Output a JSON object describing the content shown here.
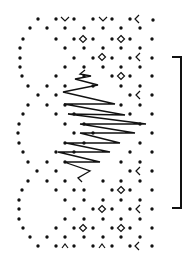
{
  "diagram": {
    "type": "knitting-lace-chart",
    "background": "#ffffff",
    "ink": "#111111",
    "dot_radius": 1.7,
    "dots": [
      [
        38,
        19
      ],
      [
        56,
        19
      ],
      [
        74,
        19
      ],
      [
        93,
        19
      ],
      [
        112,
        19
      ],
      [
        130,
        19
      ],
      [
        153,
        20
      ],
      [
        30,
        28
      ],
      [
        47,
        28
      ],
      [
        65,
        28
      ],
      [
        84,
        28
      ],
      [
        103,
        28
      ],
      [
        121,
        28
      ],
      [
        140,
        28
      ],
      [
        23,
        39
      ],
      [
        56,
        39
      ],
      [
        74,
        39
      ],
      [
        93,
        39
      ],
      [
        112,
        39
      ],
      [
        130,
        39
      ],
      [
        152,
        39
      ],
      [
        20,
        48
      ],
      [
        65,
        48
      ],
      [
        84,
        48
      ],
      [
        103,
        48
      ],
      [
        121,
        48
      ],
      [
        140,
        48
      ],
      [
        20,
        58
      ],
      [
        74,
        58
      ],
      [
        93,
        58
      ],
      [
        112,
        58
      ],
      [
        130,
        58
      ],
      [
        152,
        58
      ],
      [
        20,
        67
      ],
      [
        65,
        67
      ],
      [
        84,
        67
      ],
      [
        103,
        67
      ],
      [
        121,
        67
      ],
      [
        140,
        67
      ],
      [
        22,
        76
      ],
      [
        56,
        76
      ],
      [
        84,
        76
      ],
      [
        112,
        76
      ],
      [
        130,
        76
      ],
      [
        152,
        76
      ],
      [
        28,
        86
      ],
      [
        47,
        86
      ],
      [
        65,
        86
      ],
      [
        93,
        86
      ],
      [
        121,
        86
      ],
      [
        140,
        86
      ],
      [
        38,
        95
      ],
      [
        56,
        95
      ],
      [
        130,
        95
      ],
      [
        152,
        95
      ],
      [
        28,
        105
      ],
      [
        47,
        105
      ],
      [
        65,
        105
      ],
      [
        121,
        105
      ],
      [
        140,
        105
      ],
      [
        23,
        114
      ],
      [
        56,
        114
      ],
      [
        74,
        114
      ],
      [
        130,
        114
      ],
      [
        152,
        114
      ],
      [
        19,
        124
      ],
      [
        65,
        124
      ],
      [
        84,
        124
      ],
      [
        140,
        124
      ],
      [
        18,
        133
      ],
      [
        74,
        133
      ],
      [
        93,
        133
      ],
      [
        152,
        133
      ],
      [
        19,
        143
      ],
      [
        65,
        143
      ],
      [
        84,
        143
      ],
      [
        140,
        143
      ],
      [
        23,
        152
      ],
      [
        56,
        152
      ],
      [
        74,
        152
      ],
      [
        130,
        152
      ],
      [
        152,
        152
      ],
      [
        28,
        162
      ],
      [
        47,
        162
      ],
      [
        65,
        162
      ],
      [
        121,
        162
      ],
      [
        140,
        162
      ],
      [
        37,
        171
      ],
      [
        56,
        171
      ],
      [
        130,
        171
      ],
      [
        152,
        171
      ],
      [
        28,
        181
      ],
      [
        47,
        181
      ],
      [
        65,
        181
      ],
      [
        103,
        181
      ],
      [
        121,
        181
      ],
      [
        140,
        181
      ],
      [
        22,
        190
      ],
      [
        56,
        190
      ],
      [
        74,
        190
      ],
      [
        84,
        190
      ],
      [
        112,
        190
      ],
      [
        130,
        190
      ],
      [
        152,
        190
      ],
      [
        19,
        200
      ],
      [
        65,
        200
      ],
      [
        84,
        200
      ],
      [
        103,
        200
      ],
      [
        121,
        200
      ],
      [
        140,
        200
      ],
      [
        19,
        209
      ],
      [
        74,
        209
      ],
      [
        93,
        209
      ],
      [
        112,
        209
      ],
      [
        130,
        209
      ],
      [
        152,
        209
      ],
      [
        19,
        219
      ],
      [
        65,
        219
      ],
      [
        84,
        219
      ],
      [
        103,
        219
      ],
      [
        121,
        219
      ],
      [
        140,
        219
      ],
      [
        23,
        228
      ],
      [
        56,
        228
      ],
      [
        74,
        228
      ],
      [
        93,
        228
      ],
      [
        112,
        228
      ],
      [
        130,
        228
      ],
      [
        152,
        228
      ],
      [
        30,
        237
      ],
      [
        47,
        237
      ],
      [
        65,
        237
      ],
      [
        84,
        237
      ],
      [
        103,
        237
      ],
      [
        121,
        237
      ],
      [
        140,
        237
      ],
      [
        38,
        246
      ],
      [
        56,
        246
      ],
      [
        74,
        246
      ],
      [
        93,
        246
      ],
      [
        112,
        246
      ],
      [
        130,
        246
      ],
      [
        152,
        246
      ]
    ],
    "symbols": [
      {
        "kind": "v",
        "x": 65,
        "y": 19
      },
      {
        "kind": "v",
        "x": 103,
        "y": 19
      },
      {
        "kind": "lt",
        "x": 137,
        "y": 19
      },
      {
        "kind": "diamond",
        "x": 83,
        "y": 39
      },
      {
        "kind": "diamond",
        "x": 121,
        "y": 39
      },
      {
        "kind": "diamond",
        "x": 102,
        "y": 57
      },
      {
        "kind": "lt",
        "x": 138,
        "y": 57
      },
      {
        "kind": "diamond",
        "x": 121,
        "y": 76
      },
      {
        "kind": "lt",
        "x": 138,
        "y": 95
      },
      {
        "kind": "lt",
        "x": 138,
        "y": 171
      },
      {
        "kind": "diamond",
        "x": 121,
        "y": 190
      },
      {
        "kind": "diamond",
        "x": 102,
        "y": 209
      },
      {
        "kind": "lt",
        "x": 138,
        "y": 209
      },
      {
        "kind": "diamond",
        "x": 83,
        "y": 228
      },
      {
        "kind": "diamond",
        "x": 121,
        "y": 228
      },
      {
        "kind": "caret",
        "x": 65,
        "y": 246
      },
      {
        "kind": "caret",
        "x": 102,
        "y": 246
      },
      {
        "kind": "lt",
        "x": 137,
        "y": 246
      }
    ],
    "zigzag": [
      [
        85,
        70
      ],
      [
        80,
        74
      ],
      [
        91,
        76
      ],
      [
        75,
        79
      ],
      [
        98,
        85
      ],
      [
        63,
        92
      ],
      [
        115,
        104
      ],
      [
        64,
        104
      ],
      [
        125,
        115
      ],
      [
        68,
        114
      ],
      [
        146,
        124
      ],
      [
        80,
        124
      ],
      [
        135,
        133
      ],
      [
        80,
        133
      ],
      [
        120,
        143
      ],
      [
        66,
        143
      ],
      [
        110,
        152
      ],
      [
        58,
        152
      ],
      [
        100,
        162
      ],
      [
        64,
        162
      ],
      [
        90,
        171
      ],
      [
        78,
        178
      ],
      [
        82,
        182
      ]
    ],
    "bracket": {
      "x_left": 172,
      "x_right": 181,
      "y_top": 57,
      "y_bottom": 208,
      "stroke_width": 2
    }
  }
}
